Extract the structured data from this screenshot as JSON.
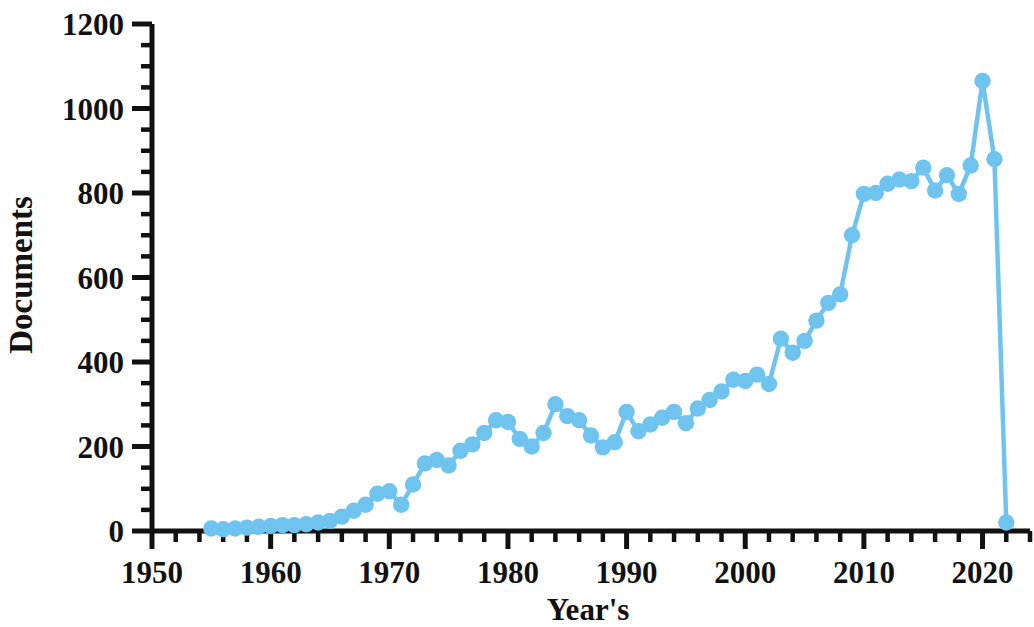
{
  "chart_data": {
    "type": "line",
    "title": "",
    "xlabel": "Year's",
    "ylabel": "Documents",
    "xlim": [
      1950,
      2024
    ],
    "ylim": [
      0,
      1200
    ],
    "xticks": [
      1950,
      1960,
      1970,
      1980,
      1990,
      2000,
      2010,
      2020
    ],
    "yticks": [
      0,
      200,
      400,
      600,
      800,
      1000,
      1200
    ],
    "x_minor_interval": 2,
    "y_minor_interval": 50,
    "grid": false,
    "legend": null,
    "series_color": "#6FC4EF",
    "marker": "circle",
    "x": [
      1955,
      1956,
      1957,
      1958,
      1959,
      1960,
      1961,
      1962,
      1963,
      1964,
      1965,
      1966,
      1967,
      1968,
      1969,
      1970,
      1971,
      1972,
      1973,
      1974,
      1975,
      1976,
      1977,
      1978,
      1979,
      1980,
      1981,
      1982,
      1983,
      1984,
      1985,
      1986,
      1987,
      1988,
      1989,
      1990,
      1991,
      1992,
      1993,
      1994,
      1995,
      1996,
      1997,
      1998,
      1999,
      2000,
      2001,
      2002,
      2003,
      2004,
      2005,
      2006,
      2007,
      2008,
      2009,
      2010,
      2011,
      2012,
      2013,
      2014,
      2015,
      2016,
      2017,
      2018,
      2019,
      2020,
      2021,
      2022
    ],
    "values": [
      6,
      4,
      6,
      8,
      10,
      12,
      14,
      14,
      16,
      20,
      24,
      34,
      48,
      62,
      88,
      94,
      62,
      110,
      160,
      168,
      155,
      190,
      205,
      232,
      262,
      258,
      218,
      200,
      232,
      300,
      272,
      262,
      226,
      198,
      210,
      282,
      236,
      252,
      268,
      282,
      255,
      290,
      310,
      330,
      358,
      355,
      370,
      348,
      455,
      422,
      450,
      498,
      540,
      560,
      700,
      798,
      800,
      822,
      832,
      828,
      860,
      806,
      842,
      798,
      865,
      1065,
      880,
      20
    ],
    "annotations": [
      {
        "label": "peak",
        "x": 2020,
        "y": 1065
      },
      {
        "label": "drop",
        "x": 2022,
        "y": 20
      }
    ]
  },
  "axes": {
    "y_tick_labels": [
      "0",
      "200",
      "400",
      "600",
      "800",
      "1000",
      "1200"
    ],
    "x_tick_labels": [
      "1950",
      "1960",
      "1970",
      "1980",
      "1990",
      "2000",
      "2010",
      "2020"
    ],
    "y_axis_title": "Documents",
    "x_axis_title": "Year's"
  }
}
